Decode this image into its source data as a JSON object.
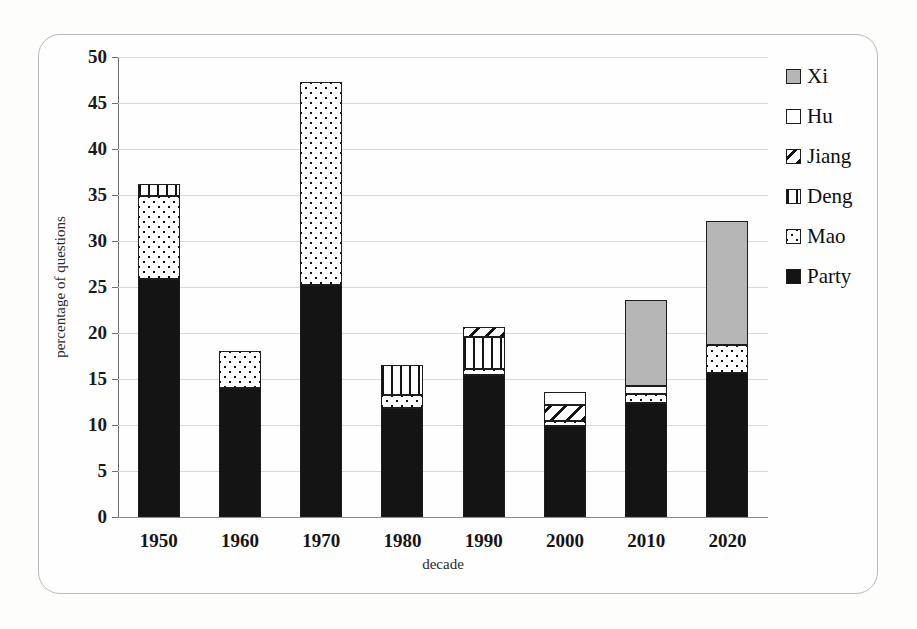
{
  "chart_data": {
    "type": "bar",
    "stacked": true,
    "title": "",
    "xlabel": "decade",
    "ylabel": "percentage of questions",
    "categories": [
      "1950",
      "1960",
      "1970",
      "1980",
      "1990",
      "2000",
      "2010",
      "2020"
    ],
    "ylim": [
      0,
      50
    ],
    "yticks": [
      0,
      5,
      10,
      15,
      20,
      25,
      30,
      35,
      40,
      45,
      50
    ],
    "ytick_labels": [
      "0",
      "5",
      "10",
      "15",
      "20",
      "25",
      "30",
      "35",
      "40",
      "45",
      "50"
    ],
    "grid": true,
    "legend_position": "right",
    "series": [
      {
        "name": "Party",
        "pattern": "solid-black",
        "color": "#141414",
        "values": [
          25.9,
          14.0,
          25.2,
          11.8,
          15.4,
          9.9,
          12.4,
          15.6
        ]
      },
      {
        "name": "Mao",
        "pattern": "dotted",
        "color": "#ffffff",
        "values": [
          9.0,
          4.0,
          22.1,
          1.5,
          0.7,
          0.5,
          1.0,
          3.1
        ]
      },
      {
        "name": "Deng",
        "pattern": "vertical-stripes",
        "color": "#ffffff",
        "values": [
          1.3,
          0.0,
          0.0,
          3.2,
          3.5,
          0.0,
          0.0,
          0.0
        ]
      },
      {
        "name": "Jiang",
        "pattern": "diagonal-hatch",
        "color": "#ffffff",
        "values": [
          0.0,
          0.0,
          0.0,
          0.0,
          1.0,
          1.8,
          0.0,
          0.0
        ]
      },
      {
        "name": "Hu",
        "pattern": "white",
        "color": "#ffffff",
        "values": [
          0.0,
          0.0,
          0.0,
          0.0,
          0.0,
          1.4,
          0.8,
          0.0
        ]
      },
      {
        "name": "Xi",
        "pattern": "grey",
        "color": "#b6b6b6",
        "values": [
          0.0,
          0.0,
          0.0,
          0.0,
          0.0,
          0.0,
          9.4,
          13.5
        ]
      }
    ],
    "totals": [
      36.2,
      18.0,
      47.3,
      16.5,
      20.6,
      13.6,
      23.6,
      32.2
    ]
  },
  "legend": {
    "items": [
      {
        "label": "Xi",
        "key": "xi"
      },
      {
        "label": "Hu",
        "key": "hu"
      },
      {
        "label": "Jiang",
        "key": "jiang"
      },
      {
        "label": "Deng",
        "key": "deng"
      },
      {
        "label": "Mao",
        "key": "mao"
      },
      {
        "label": "Party",
        "key": "party"
      }
    ]
  },
  "colors": {
    "xi": "#b6b6b6",
    "party": "#141414",
    "outline": "#1d1d1d",
    "grid": "#d8d8d8",
    "axis": "#6d6d6d",
    "background": "#fdfdfc"
  }
}
